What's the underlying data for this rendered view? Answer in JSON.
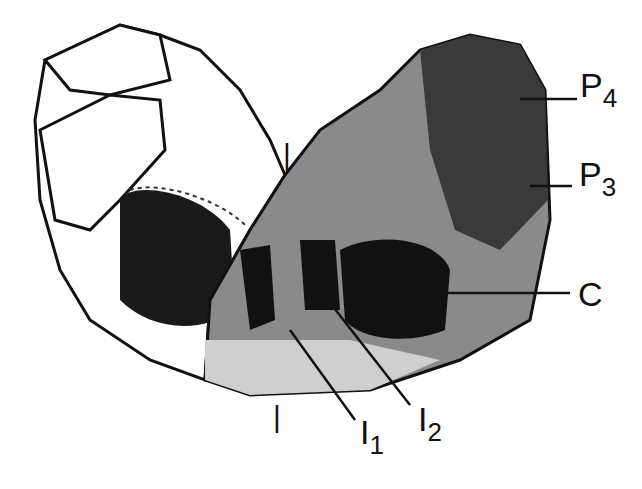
{
  "figure": {
    "labels": {
      "p4": {
        "main": "P",
        "sub": "4"
      },
      "p3": {
        "main": "P",
        "sub": "3"
      },
      "c": {
        "main": "C",
        "sub": ""
      },
      "i1": {
        "main": "I",
        "sub": "1"
      },
      "i2": {
        "main": "I",
        "sub": "2"
      },
      "midline_top": "|",
      "midline_bottom": "|"
    },
    "colors": {
      "ink": "#111111",
      "bone_light": "#dcdcdc",
      "bone_dark": "#3a3a3a",
      "background": "#ffffff"
    }
  }
}
